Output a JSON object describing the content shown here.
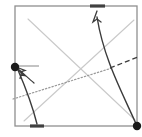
{
  "figure": {
    "title": "",
    "width": 142,
    "height": 137,
    "background_color": "#ffffff"
  },
  "colors": {
    "frame": "#8f8f8f",
    "guide_gray": "#c9c9c9",
    "curve_dark": "#3b3b3b",
    "dotted": "#9a9a9a",
    "dashed_dark": "#3b3b3b",
    "marker_fill": "#1a1a1a",
    "edge_mark": "#404040",
    "leader_line": "#9a9a9a"
  },
  "frame": {
    "name": "bounding-box",
    "x1": 15,
    "y1": 6,
    "x2": 137,
    "y2": 126,
    "stroke_width": 1.3
  },
  "markers": [
    {
      "name": "node-left",
      "label": "",
      "cx": 15,
      "cy": 67,
      "r": 4.2
    },
    {
      "name": "node-bottom-right",
      "label": "",
      "cx": 137,
      "cy": 126,
      "r": 4.2
    }
  ],
  "edge_marks": [
    {
      "name": "top-edge-mark",
      "x1": 90,
      "y1": 6,
      "x2": 105,
      "y2": 6,
      "stroke_width": 3.2
    },
    {
      "name": "bottom-edge-mark",
      "x1": 30,
      "y1": 126,
      "x2": 44,
      "y2": 126,
      "stroke_width": 3.2
    }
  ],
  "guide_lines": [
    {
      "name": "guide-diagonal-down",
      "x1": 28,
      "y1": 19,
      "x2": 135,
      "y2": 120,
      "stroke_width": 1.1
    },
    {
      "name": "guide-diagonal-up",
      "x1": 24,
      "y1": 121,
      "x2": 134,
      "y2": 20,
      "stroke_width": 1.1
    }
  ],
  "dotted_line": {
    "name": "dotted-trend-line",
    "x1": 13,
    "y1": 99,
    "x2": 112,
    "y2": 68,
    "dash": "1.4 2.0",
    "stroke_width": 1.2
  },
  "dashed_line": {
    "name": "dashed-trend-extension",
    "x1": 110,
    "y1": 68,
    "x2": 138,
    "y2": 57,
    "dash": "5 3",
    "stroke_width": 1.3
  },
  "curves": [
    {
      "name": "curve-to-top-arrow",
      "path": "M 137 126 C 122 92, 104 60, 97 17",
      "stroke_width": 1.4,
      "arrow": "end"
    },
    {
      "name": "curve-to-left-node",
      "path": "M 37 124 C 32 104, 24 84, 18 70",
      "stroke_width": 1.4,
      "arrow": "end"
    },
    {
      "name": "arrow-to-left-node-secondary",
      "path": "M 34 83 C 28 78, 22 72, 18 69",
      "stroke_width": 1.2,
      "arrow": "end"
    }
  ],
  "leader_line": {
    "name": "left-node-leader",
    "x1": 17,
    "y1": 66,
    "x2": 39,
    "y2": 66,
    "stroke_width": 1.2
  },
  "arrowheads": [
    {
      "name": "arrowhead-top",
      "points": "97,11 93.0,22 97,19 101,22",
      "rotation": 0
    },
    {
      "name": "arrowhead-left-node-a",
      "points": "16,67 25,70.5 21.4,71.6 21.0,75.2",
      "rotation": 0
    },
    {
      "name": "arrowhead-left-node-b",
      "points": "16.5,68.5 24.5,75.5 21.0,75.0 20.0,78.5",
      "rotation": 0
    }
  ]
}
